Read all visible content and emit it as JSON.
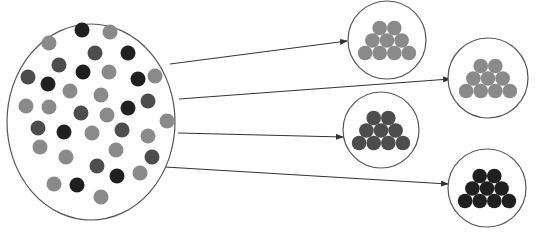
{
  "diagram": {
    "type": "sorting-into-groups",
    "colors": {
      "light": "#8a8a8a",
      "medium": "#4d4d4d",
      "dark": "#1f1f1f",
      "stroke": "#555555",
      "background": "#ffffff"
    },
    "source": {
      "cx": 91,
      "cy": 122,
      "rx": 84,
      "ry": 98,
      "dots": [
        {
          "x": 82,
          "y": 30,
          "c": "dark"
        },
        {
          "x": 110,
          "y": 32,
          "c": "light"
        },
        {
          "x": 49,
          "y": 43,
          "c": "light"
        },
        {
          "x": 95,
          "y": 53,
          "c": "medium"
        },
        {
          "x": 128,
          "y": 53,
          "c": "dark"
        },
        {
          "x": 59,
          "y": 65,
          "c": "medium"
        },
        {
          "x": 83,
          "y": 72,
          "c": "dark"
        },
        {
          "x": 109,
          "y": 72,
          "c": "light"
        },
        {
          "x": 138,
          "y": 79,
          "c": "dark"
        },
        {
          "x": 155,
          "y": 76,
          "c": "light"
        },
        {
          "x": 28,
          "y": 77,
          "c": "medium"
        },
        {
          "x": 48,
          "y": 84,
          "c": "dark"
        },
        {
          "x": 70,
          "y": 91,
          "c": "light"
        },
        {
          "x": 101,
          "y": 95,
          "c": "light"
        },
        {
          "x": 148,
          "y": 101,
          "c": "medium"
        },
        {
          "x": 26,
          "y": 106,
          "c": "light"
        },
        {
          "x": 49,
          "y": 107,
          "c": "light"
        },
        {
          "x": 81,
          "y": 113,
          "c": "medium"
        },
        {
          "x": 107,
          "y": 115,
          "c": "light"
        },
        {
          "x": 128,
          "y": 108,
          "c": "dark"
        },
        {
          "x": 167,
          "y": 121,
          "c": "light"
        },
        {
          "x": 38,
          "y": 128,
          "c": "medium"
        },
        {
          "x": 64,
          "y": 132,
          "c": "dark"
        },
        {
          "x": 92,
          "y": 133,
          "c": "light"
        },
        {
          "x": 122,
          "y": 130,
          "c": "medium"
        },
        {
          "x": 148,
          "y": 136,
          "c": "light"
        },
        {
          "x": 40,
          "y": 147,
          "c": "light"
        },
        {
          "x": 66,
          "y": 157,
          "c": "light"
        },
        {
          "x": 116,
          "y": 150,
          "c": "light"
        },
        {
          "x": 152,
          "y": 157,
          "c": "medium"
        },
        {
          "x": 97,
          "y": 166,
          "c": "medium"
        },
        {
          "x": 140,
          "y": 173,
          "c": "light"
        },
        {
          "x": 117,
          "y": 176,
          "c": "dark"
        },
        {
          "x": 54,
          "y": 184,
          "c": "light"
        },
        {
          "x": 77,
          "y": 185,
          "c": "dark"
        },
        {
          "x": 101,
          "y": 197,
          "c": "light"
        }
      ]
    },
    "groups": [
      {
        "name": "group-light-1",
        "cx": 387,
        "cy": 40,
        "r": 39,
        "color": "light"
      },
      {
        "name": "group-light-2",
        "cx": 488,
        "cy": 78,
        "r": 40,
        "color": "light"
      },
      {
        "name": "group-medium",
        "cx": 381,
        "cy": 130,
        "r": 38,
        "color": "medium"
      },
      {
        "name": "group-dark",
        "cx": 487,
        "cy": 188,
        "r": 39,
        "color": "dark"
      }
    ],
    "arrows": [
      {
        "x1": 170,
        "y1": 64,
        "x2": 347,
        "y2": 41
      },
      {
        "x1": 179,
        "y1": 99,
        "x2": 450,
        "y2": 79
      },
      {
        "x1": 178,
        "y1": 133,
        "x2": 343,
        "y2": 137
      },
      {
        "x1": 165,
        "y1": 167,
        "x2": 448,
        "y2": 184
      }
    ]
  }
}
